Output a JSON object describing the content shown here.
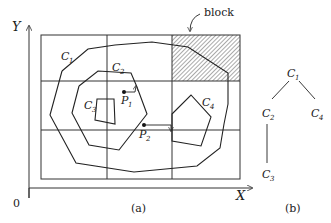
{
  "figure_a": {
    "caption": "(a)",
    "axis_y_label": "Y",
    "axis_x_label": "X",
    "origin_label": "0",
    "block_label": "block",
    "contours": [
      {
        "name": "C",
        "sub": "1"
      },
      {
        "name": "C",
        "sub": "2"
      },
      {
        "name": "C",
        "sub": "3"
      },
      {
        "name": "C",
        "sub": "4"
      }
    ],
    "points": [
      {
        "name": "P",
        "sub": "1"
      },
      {
        "name": "P",
        "sub": "2"
      }
    ]
  },
  "figure_b": {
    "caption": "(b)",
    "tree_nodes": [
      {
        "name": "C",
        "sub": "1"
      },
      {
        "name": "C",
        "sub": "2"
      },
      {
        "name": "C",
        "sub": "4"
      },
      {
        "name": "C",
        "sub": "3"
      }
    ]
  }
}
